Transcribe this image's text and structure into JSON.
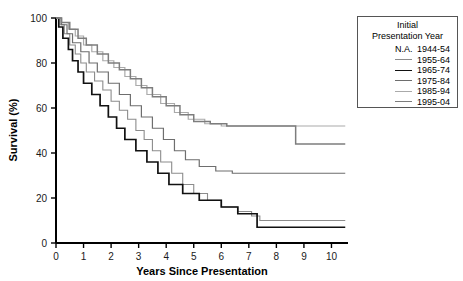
{
  "chart_data": {
    "type": "line",
    "title": "",
    "xlabel": "Years Since Presentation",
    "ylabel": "Survival (%)",
    "xlim": [
      0,
      10.6
    ],
    "ylim": [
      0,
      100
    ],
    "xticks": [
      "0",
      "1",
      "2",
      "3",
      "4",
      "5",
      "6",
      "7",
      "8",
      "9",
      "10"
    ],
    "yticks": [
      "0",
      "20",
      "40",
      "60",
      "80",
      "100"
    ],
    "grid": false,
    "legend_position": "right-outside",
    "legend_title_lines": [
      "Initial",
      "Presentation Year"
    ],
    "series": [
      {
        "name": "1944-54",
        "legend_marker": "N.A.",
        "color": "#000000",
        "width": 1.0,
        "points": []
      },
      {
        "name": "1955-64",
        "legend_marker": "line",
        "color": "#8c8c8c",
        "width": 1.1,
        "points": [
          [
            0,
            100
          ],
          [
            0.15,
            97
          ],
          [
            0.3,
            93
          ],
          [
            0.5,
            88
          ],
          [
            0.7,
            84
          ],
          [
            0.9,
            80
          ],
          [
            1.1,
            76
          ],
          [
            1.4,
            72
          ],
          [
            1.7,
            68
          ],
          [
            2.0,
            63
          ],
          [
            2.3,
            59
          ],
          [
            2.6,
            55
          ],
          [
            2.9,
            50
          ],
          [
            3.2,
            46
          ],
          [
            3.5,
            41
          ],
          [
            3.8,
            36
          ],
          [
            4.2,
            31
          ],
          [
            4.6,
            26
          ],
          [
            5.0,
            22
          ],
          [
            5.5,
            19
          ],
          [
            6.0,
            16
          ],
          [
            6.6,
            14
          ],
          [
            7.1,
            12
          ],
          [
            7.4,
            10
          ],
          [
            8.0,
            10
          ],
          [
            9.0,
            10
          ],
          [
            10.5,
            10
          ]
        ]
      },
      {
        "name": "1965-74",
        "legend_marker": "line",
        "color": "#111111",
        "width": 1.7,
        "points": [
          [
            0,
            100
          ],
          [
            0.1,
            96
          ],
          [
            0.25,
            91
          ],
          [
            0.45,
            86
          ],
          [
            0.6,
            81
          ],
          [
            0.8,
            76
          ],
          [
            1.0,
            71
          ],
          [
            1.3,
            66
          ],
          [
            1.6,
            61
          ],
          [
            1.9,
            56
          ],
          [
            2.2,
            51
          ],
          [
            2.5,
            46
          ],
          [
            2.9,
            41
          ],
          [
            3.3,
            36
          ],
          [
            3.7,
            31
          ],
          [
            4.1,
            26
          ],
          [
            4.6,
            22
          ],
          [
            5.2,
            19
          ],
          [
            6.0,
            16
          ],
          [
            6.6,
            13
          ],
          [
            7.3,
            7
          ],
          [
            8.0,
            7
          ],
          [
            9.0,
            7
          ],
          [
            10.5,
            7
          ]
        ]
      },
      {
        "name": "1975-84",
        "legend_marker": "line",
        "color": "#6e6e6e",
        "width": 1.2,
        "points": [
          [
            0,
            100
          ],
          [
            0.2,
            97
          ],
          [
            0.4,
            93
          ],
          [
            0.6,
            89
          ],
          [
            0.9,
            85
          ],
          [
            1.2,
            80
          ],
          [
            1.5,
            76
          ],
          [
            1.9,
            71
          ],
          [
            2.3,
            66
          ],
          [
            2.7,
            61
          ],
          [
            3.1,
            56
          ],
          [
            3.5,
            51
          ],
          [
            3.9,
            46
          ],
          [
            4.3,
            41
          ],
          [
            4.7,
            37
          ],
          [
            5.2,
            34
          ],
          [
            5.8,
            32
          ],
          [
            6.4,
            31
          ],
          [
            7.2,
            31
          ],
          [
            8.0,
            31
          ],
          [
            9.0,
            31
          ],
          [
            10.5,
            31
          ]
        ]
      },
      {
        "name": "1985-94",
        "legend_marker": "line",
        "color": "#aaaaaa",
        "width": 1.2,
        "points": [
          [
            0,
            100
          ],
          [
            0.2,
            98
          ],
          [
            0.45,
            95
          ],
          [
            0.7,
            92
          ],
          [
            1.0,
            88
          ],
          [
            1.3,
            85
          ],
          [
            1.7,
            81
          ],
          [
            2.1,
            78
          ],
          [
            2.5,
            74
          ],
          [
            2.9,
            70
          ],
          [
            3.3,
            66
          ],
          [
            3.8,
            62
          ],
          [
            4.3,
            58
          ],
          [
            4.8,
            55
          ],
          [
            5.4,
            53
          ],
          [
            6.0,
            52
          ],
          [
            7.0,
            52
          ],
          [
            8.0,
            52
          ],
          [
            8.6,
            52
          ],
          [
            9.0,
            52
          ],
          [
            10.5,
            52
          ]
        ]
      },
      {
        "name": "1995-04",
        "legend_marker": "line",
        "color": "#7d7d7d",
        "width": 1.5,
        "points": [
          [
            0,
            100
          ],
          [
            0.2,
            98
          ],
          [
            0.5,
            95
          ],
          [
            0.8,
            91
          ],
          [
            1.1,
            88
          ],
          [
            1.5,
            84
          ],
          [
            1.9,
            80
          ],
          [
            2.3,
            77
          ],
          [
            2.7,
            73
          ],
          [
            3.1,
            69
          ],
          [
            3.5,
            65
          ],
          [
            4.0,
            61
          ],
          [
            4.5,
            57
          ],
          [
            5.0,
            54
          ],
          [
            5.6,
            53
          ],
          [
            6.2,
            52
          ],
          [
            7.0,
            52
          ],
          [
            7.8,
            52
          ],
          [
            8.6,
            52
          ],
          [
            8.7,
            44
          ],
          [
            9.5,
            44
          ],
          [
            10.5,
            44
          ]
        ]
      }
    ]
  },
  "legend": {
    "title_line1": "Initial",
    "title_line2": "Presentation Year",
    "items": [
      {
        "marker": "N.A.",
        "label": "1944-54"
      },
      {
        "marker": "line",
        "label": "1955-64"
      },
      {
        "marker": "line",
        "label": "1965-74"
      },
      {
        "marker": "line",
        "label": "1975-84"
      },
      {
        "marker": "line",
        "label": "1985-94"
      },
      {
        "marker": "line",
        "label": "1995-04"
      }
    ]
  }
}
